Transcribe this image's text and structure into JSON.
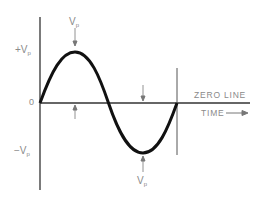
{
  "diagram": {
    "type": "sine-wave",
    "labels": {
      "peak_top": {
        "main": "V",
        "sub": "p"
      },
      "peak_bottom": {
        "main": "V",
        "sub": "p"
      },
      "plus_vp": {
        "main": "+V",
        "sub": "p"
      },
      "minus_vp": {
        "main": "−V",
        "sub": "p"
      },
      "origin": "0",
      "zero_line": "ZERO LINE",
      "time": "TIME"
    },
    "colors": {
      "curve": "#111111",
      "axis": "#333333",
      "label": "#8a8a8a"
    }
  }
}
